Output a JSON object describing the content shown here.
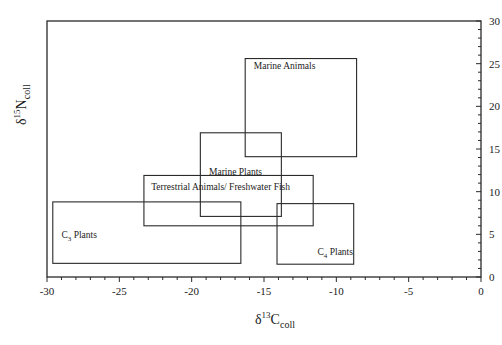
{
  "chart_data": {
    "type": "scatter",
    "subtype": "range-boxes",
    "title": "",
    "xlabel": "δ13Ccoll",
    "xlabel_parts": {
      "symbol": "δ",
      "sup": "13",
      "base": "C",
      "sub": "coll"
    },
    "ylabel": "δ15Ncoll",
    "ylabel_parts": {
      "symbol": "δ",
      "sup": "15",
      "base": "N",
      "sub": "coll"
    },
    "xlim": [
      -30,
      0
    ],
    "ylim": [
      0,
      30
    ],
    "x_ticks": [
      -30,
      -25,
      -20,
      -15,
      -10,
      -5,
      0
    ],
    "x_tick_labels": [
      "-30",
      "-25",
      "-20",
      "-15",
      "-10",
      "-5",
      "0"
    ],
    "y_ticks": [
      0,
      5,
      10,
      15,
      20,
      25,
      30
    ],
    "y_tick_labels": [
      "0",
      "5",
      "10",
      "15",
      "20",
      "25",
      "30"
    ],
    "y_axis_side": "right",
    "x_minor_step": 1,
    "y_minor_step": 1,
    "grid": false,
    "legend": null,
    "series": [
      {
        "name": "Marine Animals",
        "x_range": [
          -16.3,
          -8.6
        ],
        "y_range": [
          14.1,
          25.6
        ],
        "label_pos": [
          -15.7,
          24.4
        ]
      },
      {
        "name": "Marine Plants",
        "x_range": [
          -19.4,
          -13.8
        ],
        "y_range": [
          7.1,
          16.9
        ],
        "label_pos": [
          -18.8,
          11.9
        ]
      },
      {
        "name": "Terrestrial Animals/ Freshwater Fish",
        "x_range": [
          -23.3,
          -11.6
        ],
        "y_range": [
          6.0,
          11.9
        ],
        "label_pos": [
          -22.8,
          10.2
        ]
      },
      {
        "name": "C3 Plants",
        "label_base": "C",
        "label_sub": "3",
        "label_rest": " Plants",
        "x_range": [
          -29.6,
          -16.6
        ],
        "y_range": [
          1.6,
          8.8
        ],
        "label_pos": [
          -29.0,
          4.6
        ]
      },
      {
        "name": "C4 Plants",
        "label_base": "C",
        "label_sub": "4",
        "label_rest": " Plants",
        "x_range": [
          -14.1,
          -8.8
        ],
        "y_range": [
          1.5,
          8.6
        ],
        "label_pos": [
          -11.3,
          2.6
        ]
      }
    ]
  }
}
